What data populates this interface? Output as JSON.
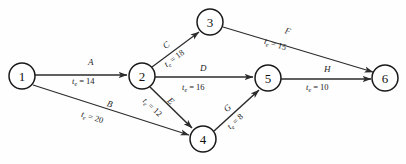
{
  "diagram": {
    "type": "directed-network",
    "background_color": "#fefefe",
    "line_color": "#2b2b2b",
    "text_color": "#1b1b1b",
    "duration_symbol": "t",
    "duration_subscript": "e",
    "equals": "=",
    "nodes": [
      {
        "id": "1",
        "label": "1",
        "cx": 22,
        "cy": 76,
        "r": 13
      },
      {
        "id": "2",
        "label": "2",
        "cx": 142,
        "cy": 76,
        "r": 13
      },
      {
        "id": "3",
        "label": "3",
        "cx": 210,
        "cy": 22,
        "r": 13
      },
      {
        "id": "4",
        "label": "4",
        "cx": 203,
        "cy": 139,
        "r": 13
      },
      {
        "id": "5",
        "label": "5",
        "cx": 268,
        "cy": 78,
        "r": 13
      },
      {
        "id": "6",
        "label": "6",
        "cx": 385,
        "cy": 78,
        "r": 13
      }
    ],
    "edges": [
      {
        "id": "A",
        "activity": "A",
        "from": "1",
        "to": "2",
        "te": "14",
        "te_text": "= 14"
      },
      {
        "id": "B",
        "activity": "B",
        "from": "1",
        "to": "4",
        "te": "20",
        "te_text": "= 20"
      },
      {
        "id": "C",
        "activity": "C",
        "from": "2",
        "to": "3",
        "te": "18",
        "te_text": "= 18"
      },
      {
        "id": "D",
        "activity": "D",
        "from": "2",
        "to": "5",
        "te": "16",
        "te_text": "= 16"
      },
      {
        "id": "E",
        "activity": "E",
        "from": "2",
        "to": "4",
        "te": "12",
        "te_text": "= 12"
      },
      {
        "id": "F",
        "activity": "F",
        "from": "3",
        "to": "6",
        "te": "15",
        "te_text": "= 15"
      },
      {
        "id": "G",
        "activity": "G",
        "from": "4",
        "to": "5",
        "te": "8",
        "te_text": "= 8"
      },
      {
        "id": "H",
        "activity": "H",
        "from": "5",
        "to": "6",
        "te": "10",
        "te_text": "= 10"
      }
    ]
  }
}
